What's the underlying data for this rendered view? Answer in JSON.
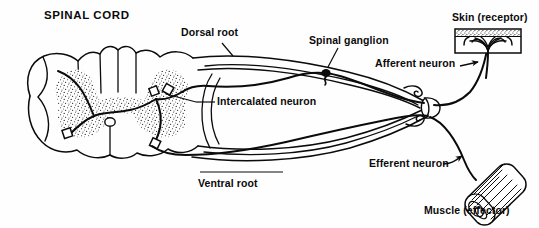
{
  "figure": {
    "title": "SPINAL CORD",
    "ink_color": "#0b0b0b",
    "background_color": "#fefefe",
    "gray_matter_fill": "#ffffff",
    "stipple_color": "#1a1a1a"
  },
  "labels": {
    "spinal_cord": "SPINAL CORD",
    "dorsal_root": "Dorsal root",
    "spinal_ganglion": "Spinal ganglion",
    "skin_receptor": "Skin (receptor)",
    "afferent_neuron": "Afferent neuron",
    "intercalated_neuron": "Intercalated neuron",
    "ventral_root": "Ventral root",
    "efferent_neuron": "Efferent neuron",
    "muscle_effector": "Muscle (effector)"
  },
  "structures": [
    {
      "name": "spinal-cord-outline",
      "kind": "cross-section"
    },
    {
      "name": "gray-matter-butterfly",
      "kind": "stippled-region"
    },
    {
      "name": "central-canal",
      "kind": "small-oval"
    },
    {
      "name": "dorsal-root-nerve",
      "kind": "nerve-bundle"
    },
    {
      "name": "ventral-root-nerve",
      "kind": "nerve-bundle"
    },
    {
      "name": "spinal-ganglion-body",
      "kind": "cell-body"
    },
    {
      "name": "skin-receptor-block",
      "kind": "tissue-block"
    },
    {
      "name": "muscle-effector-bundle",
      "kind": "muscle-fibers"
    },
    {
      "name": "synapse-marker",
      "kind": "square-node",
      "count": 4
    }
  ]
}
